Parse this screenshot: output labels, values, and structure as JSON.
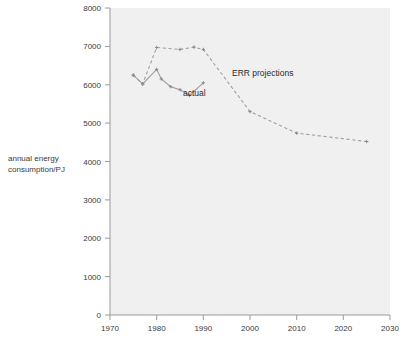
{
  "chart_data": {
    "type": "line",
    "title": "",
    "subtitle": "",
    "xlabel": "",
    "ylabel": "annual energy consumption/PJ",
    "ylabel_line1": "annual energy",
    "ylabel_line2": "consumption/PJ",
    "xlim": [
      1970,
      2030
    ],
    "ylim": [
      0,
      8000
    ],
    "xticks": [
      1970,
      1980,
      1990,
      2000,
      2010,
      2020,
      2030
    ],
    "xtick_labels": [
      "1970",
      "1980",
      "1990",
      "2000",
      "2010",
      "2020",
      "2030"
    ],
    "yticks": [
      0,
      1000,
      2000,
      3000,
      4000,
      5000,
      6000,
      7000,
      8000
    ],
    "ytick_labels": [
      "0",
      "1000",
      "2000",
      "3000",
      "4000",
      "5000",
      "6000",
      "7000",
      "8000"
    ],
    "grid": false,
    "legend": "none",
    "plot_background_color": "#f0f0f0",
    "line_color": "#9e9e9e",
    "series": [
      {
        "name": "actual",
        "style": "solid",
        "markers": true,
        "x": [
          1975,
          1977,
          1980,
          1981,
          1983,
          1985,
          1987,
          1990
        ],
        "values": [
          6250,
          6020,
          6400,
          6150,
          5950,
          5870,
          5720,
          6050
        ]
      },
      {
        "name": "ERR projections",
        "style": "dashed",
        "markers": true,
        "x": [
          1975,
          1977,
          1980,
          1985,
          1988,
          1990,
          2000,
          2010,
          2025
        ],
        "values": [
          6250,
          6020,
          6970,
          6920,
          6980,
          6920,
          5300,
          4740,
          4520
        ]
      }
    ],
    "annotations": [
      {
        "text": "ERR projections",
        "x": 2000,
        "y": 6400
      },
      {
        "text": "actual",
        "x": 1990,
        "y": 5700
      }
    ]
  }
}
